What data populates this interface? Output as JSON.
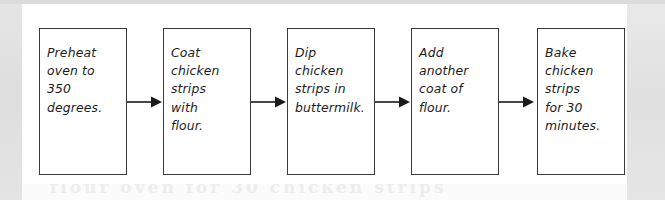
{
  "document": {
    "type": "flowchart",
    "orientation": "horizontal",
    "background_color": "#e3e3e3",
    "paper_color": "#ffffff",
    "box_border_color": "#3a3a3a",
    "arrow_color": "#1a1a1a",
    "text_color": "#1c1c1c"
  },
  "ghost_text": "flour oven for 30 chicken strips",
  "flowchart": {
    "steps": [
      {
        "index": 1,
        "text": "Preheat\noven to\n350\ndegrees.",
        "plain": "Preheat oven to 350 degrees."
      },
      {
        "index": 2,
        "text": "Coat\nchicken\nstrips\nwith\nflour.",
        "plain": "Coat chicken strips with flour."
      },
      {
        "index": 3,
        "text": "Dip\nchicken\nstrips in\nbuttermilk.",
        "plain": "Dip chicken strips in buttermilk."
      },
      {
        "index": 4,
        "text": "Add\nanother\ncoat of\nflour.",
        "plain": "Add another coat of flour."
      },
      {
        "index": 5,
        "text": "Bake\nchicken\nstrips\nfor 30\nminutes.",
        "plain": "Bake chicken strips for 30 minutes."
      }
    ],
    "connectors": [
      {
        "from": 1,
        "to": 2,
        "glyph": "arrow-right"
      },
      {
        "from": 2,
        "to": 3,
        "glyph": "arrow-right"
      },
      {
        "from": 3,
        "to": 4,
        "glyph": "arrow-right"
      },
      {
        "from": 4,
        "to": 5,
        "glyph": "arrow-right"
      }
    ]
  }
}
